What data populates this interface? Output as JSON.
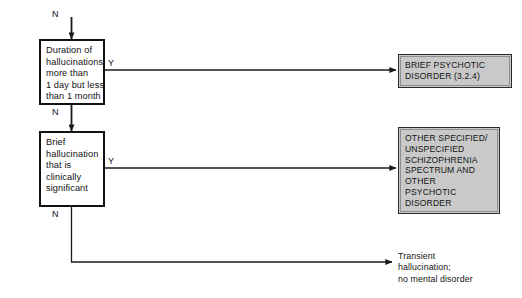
{
  "diagram": {
    "entry_label": "N",
    "colors": {
      "line": "#1a1a1a",
      "box_border": "#111111",
      "outcome_fill": "#c9c9c9",
      "outcome_border": "#2a2a2a",
      "background": "#ffffff"
    }
  },
  "decisions": [
    {
      "id": "duration",
      "lines": [
        "Duration of",
        "hallucinations",
        "more than",
        "1 day but less",
        "than 1 month"
      ],
      "yes_label": "Y",
      "no_label": "N"
    },
    {
      "id": "clinical-significance",
      "lines": [
        "Brief",
        "hallucination",
        "that is",
        "clinically",
        "significant"
      ],
      "yes_label": "Y",
      "no_label": "N"
    }
  ],
  "outcomes": [
    {
      "id": "brief-psychotic-disorder",
      "lines": [
        "BRIEF PSYCHOTIC",
        "DISORDER (3.2.4)"
      ]
    },
    {
      "id": "other-specified-unspecified",
      "lines": [
        "OTHER SPECIFIED/",
        "UNSPECIFIED",
        "SCHIZOPHRENIA",
        "SPECTRUM AND",
        "OTHER",
        "PSYCHOTIC",
        "DISORDER"
      ]
    }
  ],
  "terminal": {
    "id": "transient-hallucination",
    "lines": [
      "Transient",
      "hallucination;",
      "no mental disorder"
    ]
  }
}
